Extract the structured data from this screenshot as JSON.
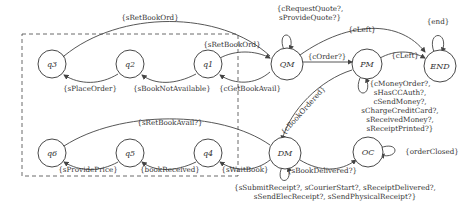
{
  "states": {
    "q3": "q3",
    "q2": "q2",
    "q1": "q1",
    "qm": "QM",
    "pm": "PM",
    "end": "END",
    "q6": "q6",
    "q5": "q5",
    "q4": "q4",
    "dm": "DM",
    "oc": "OC"
  },
  "labels": {
    "sRetBookOrd_top": "{sRetBookOrd}",
    "sRetBookOrd_q1": "{sRetBookOrd}",
    "sPlaceOrder": "{sPlaceOrder}",
    "sBookNotAvailable": "{sBookNotAvailable}",
    "cGetBookAvail": "{cGetBookAvail}",
    "qm_loop_1": "{cRequestQuote?,",
    "qm_loop_2": "sProvideQuote?}",
    "cLeft_top": "{cLeft}",
    "cOrder": "{cOrder?}",
    "cLeft_pm": "{cLeft}",
    "end_loop": "{end}",
    "pm_loop": [
      "{cMoneyOrder?,",
      "sHasCCAuth?,",
      "cSendMoney?,",
      "sChargeCreditCard?,",
      "sReceivedMoney?,",
      "sReceiptPrinted?}"
    ],
    "cBookOrdered": "{cBookOrdered}",
    "sRetBookAvail": "{sRetBookAvail?}",
    "sProvidePrice": "{sProvidePrice}",
    "bookReceived": "{bookReceived}",
    "sWaitBook": "{sWaitBook}",
    "sBookDelivered": "{sBookDelivered?}",
    "orderClosed": "{orderClosed}",
    "dm_loop_1": "{sSubmitReceipt?, sCourierStart?, sReceiptDelivered?,",
    "dm_loop_2": "sSendElecReceipt?, sSendPhysicalReceipt?}"
  }
}
